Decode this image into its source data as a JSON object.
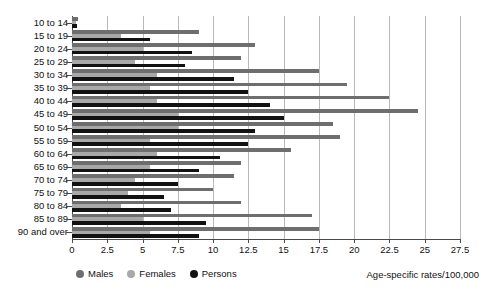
{
  "chart_data": {
    "type": "bar",
    "orientation": "horizontal",
    "title": "",
    "xlabel": "Age-specific rates/100,000",
    "ylabel": "",
    "xlim": [
      0,
      27.5
    ],
    "xticks": [
      0,
      2.5,
      5,
      7.5,
      10,
      12.5,
      15,
      17.5,
      20,
      22.5,
      25,
      27.5
    ],
    "xticklabels": [
      "0",
      "2.5",
      "5",
      "7.5",
      "10",
      "12.5",
      "15",
      "17.5",
      "20",
      "22.5",
      "25",
      "27.5"
    ],
    "grid": true,
    "grid_axis": "x",
    "legend_position": "bottom-left",
    "categories": [
      "10 to 14",
      "15 to 19",
      "20 to 24",
      "25 to 29",
      "30 to 34",
      "35 to 39",
      "40 to 44",
      "45 to 49",
      "50 to 54",
      "55 to 59",
      "60 to 64",
      "65 to 69",
      "70 to 74",
      "75 to 79",
      "80 to 84",
      "85 to 89",
      "90 and over"
    ],
    "series": [
      {
        "name": "Males",
        "color": "#6e6e6e",
        "values": [
          0.4,
          9.0,
          13.0,
          12.0,
          17.5,
          19.5,
          22.5,
          24.5,
          18.5,
          19.0,
          15.5,
          12.0,
          11.5,
          10.0,
          12.0,
          17.0,
          17.5
        ]
      },
      {
        "name": "Females",
        "color": "#a8a8a8",
        "values": [
          0.3,
          3.5,
          5.0,
          4.5,
          6.0,
          5.5,
          6.0,
          7.5,
          7.5,
          5.5,
          6.0,
          5.5,
          4.5,
          4.0,
          3.5,
          5.0,
          5.5
        ]
      },
      {
        "name": "Persons",
        "color": "#121212",
        "values": [
          0.35,
          5.5,
          8.5,
          8.0,
          11.5,
          12.5,
          14.0,
          15.0,
          13.0,
          12.5,
          10.5,
          9.0,
          7.5,
          6.5,
          7.0,
          9.5,
          9.0
        ]
      }
    ]
  },
  "legend": {
    "items": [
      {
        "label": "Males",
        "color": "#6e6e6e"
      },
      {
        "label": "Females",
        "color": "#a8a8a8"
      },
      {
        "label": "Persons",
        "color": "#121212"
      }
    ]
  },
  "axis_title": "Age-specific rates/100,000"
}
